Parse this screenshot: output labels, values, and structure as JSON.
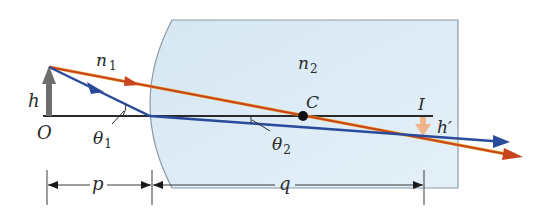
{
  "diagram": {
    "labels": {
      "n1": "n",
      "n1_sub": "1",
      "n2": "n",
      "n2_sub": "2",
      "h": "h",
      "O": "O",
      "theta1": "θ",
      "theta1_sub": "1",
      "theta2": "θ",
      "theta2_sub": "2",
      "C": "C",
      "I": "I",
      "h_prime": "h′",
      "p": "p",
      "q": "q"
    },
    "colors": {
      "medium_fill": "#ddebf5",
      "medium_edge": "#8a9aa4",
      "red_ray": "#c8451e",
      "red_ray_highlight": "#e8a22a",
      "blue_ray": "#2a4a9a",
      "axis": "#2a2a2a",
      "object_arrow": "#6e6e6e",
      "image_arrow": "#f0b48a",
      "center_point": "#111111",
      "dimension_lines": "#3a3a3a"
    },
    "elements": {
      "object": {
        "name": "O",
        "height_label": "h",
        "x": 49,
        "base_y": 116,
        "tip_y": 67
      },
      "image": {
        "name": "I",
        "height_label": "h′",
        "x": 423,
        "top_y": 116,
        "bottom_y": 135
      },
      "center_of_curvature": {
        "name": "C",
        "x": 303,
        "y": 116
      },
      "refracting_surface": {
        "type": "convex",
        "vertex_x": 150
      },
      "dimensions": [
        {
          "label": "p",
          "from_x": 47,
          "to_x": 152
        },
        {
          "label": "q",
          "from_x": 152,
          "to_x": 424
        }
      ]
    }
  }
}
